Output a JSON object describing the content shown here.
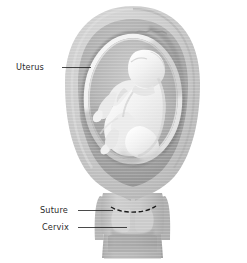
{
  "figure": {
    "background_color": "#ffffff"
  },
  "labels": [
    {
      "id": "uterus",
      "text": "Uterus",
      "x": 16,
      "y": 70,
      "leader": {
        "x1": 62,
        "y1": 67.5,
        "x2": 91,
        "y2": 67.5
      }
    },
    {
      "id": "suture",
      "text": "Suture",
      "x": 40,
      "y": 213,
      "leader": {
        "x1": 78,
        "y1": 210.5,
        "x2": 113,
        "y2": 210.5
      }
    },
    {
      "id": "cervix",
      "text": "Cervix",
      "x": 42,
      "y": 230,
      "leader": {
        "x1": 78,
        "y1": 227.5,
        "x2": 127,
        "y2": 227.5
      }
    }
  ],
  "colors": {
    "outer_wall": "#c6c6c6",
    "outer_wall_light": "#d4d4d4",
    "myometrium": "#b3b3b3",
    "myometrium_shadow": "#9a9a9a",
    "cavity_dark": "#8f8f8f",
    "amnion_rim": "#ededed",
    "amniotic_fluid": "#b8b8b8",
    "fetus_body": "#f2f2f2",
    "fetus_shade": "#d8d8d8",
    "cervix_body": "#c2c2c2",
    "cervix_lobe": "#cfcfcf",
    "vagina_wall": "#bdbdbd",
    "vagina_canal": "#a8a8a8",
    "suture_stroke": "#1a1a1a",
    "label_text": "#2b2b2b",
    "leader_stroke": "#1c1c1c"
  },
  "structures": [
    {
      "id": "uterus-outer-wall",
      "name": "Uterus outer wall"
    },
    {
      "id": "myometrium-ring",
      "name": "Myometrium ring"
    },
    {
      "id": "uterine-cavity",
      "name": "Uterine cavity"
    },
    {
      "id": "amniotic-sac",
      "name": "Amniotic sac"
    },
    {
      "id": "fetus",
      "name": "Fetus"
    },
    {
      "id": "cervix",
      "name": "Cervix"
    },
    {
      "id": "suture",
      "name": "Cervical suture"
    },
    {
      "id": "vagina",
      "name": "Vaginal canal"
    }
  ]
}
